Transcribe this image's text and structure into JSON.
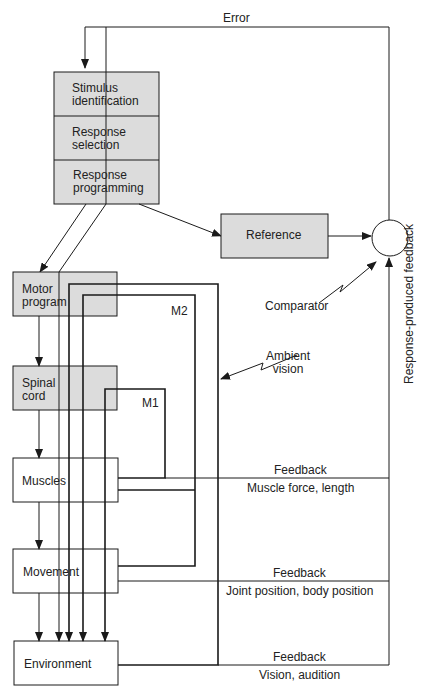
{
  "diagram": {
    "type": "motor-control-feedback-model",
    "colors": {
      "box_fill": "#dcdcdc",
      "line": "#1a1a1a",
      "background": "#ffffff"
    },
    "top_label": "Error",
    "stack": [
      {
        "id": "stimulus-identification",
        "label_line1": "Stimulus",
        "label_line2": "identification"
      },
      {
        "id": "response-selection",
        "label_line1": "Response",
        "label_line2": "selection"
      },
      {
        "id": "response-programming",
        "label_line1": "Response",
        "label_line2": "programming"
      }
    ],
    "reference": {
      "label": "Reference"
    },
    "comparator": {
      "label": "Comparator"
    },
    "response_feedback_label": "Response-produced feedback",
    "left_column": [
      {
        "id": "motor-program",
        "label_line1": "Motor",
        "label_line2": "program",
        "shaded": true
      },
      {
        "id": "spinal-cord",
        "label_line1": "Spinal",
        "label_line2": "cord",
        "shaded": true
      },
      {
        "id": "muscles",
        "label_line1": "Muscles",
        "label_line2": "",
        "shaded": false
      },
      {
        "id": "movement",
        "label_line1": "Movement",
        "label_line2": "",
        "shaded": false
      },
      {
        "id": "environment",
        "label_line1": "Environment",
        "label_line2": "",
        "shaded": false
      }
    ],
    "loops": {
      "m1": "M1",
      "m2": "M2"
    },
    "ambient_vision": {
      "line1": "Ambient",
      "line2": "vision"
    },
    "feedback_channels": [
      {
        "title": "Feedback",
        "detail": "Muscle force, length"
      },
      {
        "title": "Feedback",
        "detail": "Joint position, body position"
      },
      {
        "title": "Feedback",
        "detail": "Vision, audition"
      }
    ]
  }
}
